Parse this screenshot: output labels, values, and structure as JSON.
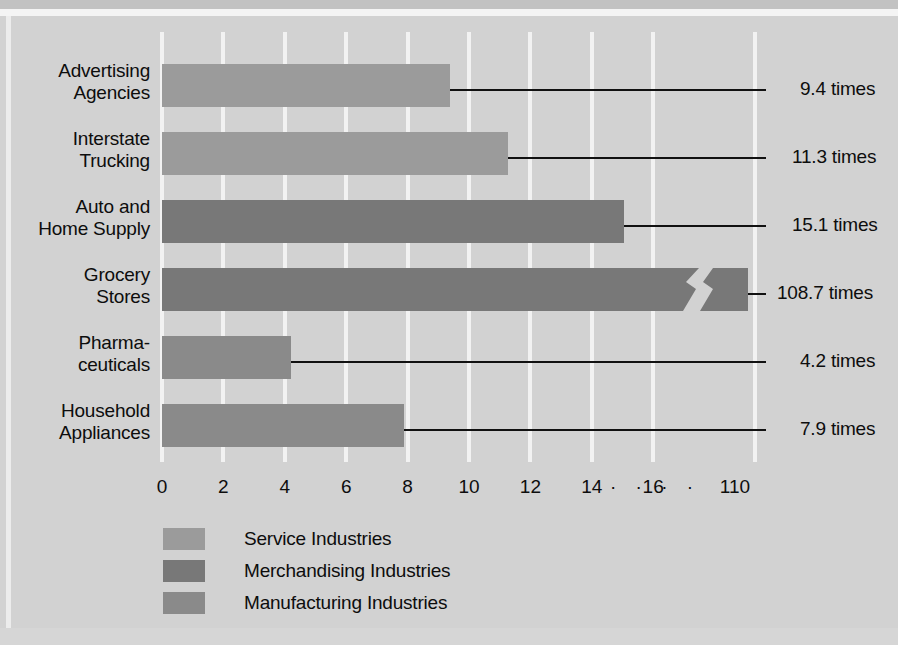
{
  "chart_data": {
    "type": "bar",
    "orientation": "horizontal",
    "title": "",
    "xlabel": "",
    "ylabel": "",
    "grid": true,
    "xlim": [
      0,
      17
    ],
    "axis_break": true,
    "axis_break_note": "16 · · · · 110",
    "categories": [
      "Advertising\nAgencies",
      "Interstate\nTrucking",
      "Auto and\nHome Supply",
      "Grocery\nStores",
      "Pharma-\nceuticals",
      "Household\nAppliances"
    ],
    "values": [
      9.4,
      11.3,
      15.1,
      108.7,
      4.2,
      7.9
    ],
    "value_labels": [
      "9.4 times",
      "11.3 times",
      "15.1 times",
      "108.7 times",
      "4.2 times",
      "7.9 times"
    ],
    "series_of_category": [
      "Service Industries",
      "Service Industries",
      "Merchandising Industries",
      "Merchandising Industries",
      "Manufacturing Industries",
      "Manufacturing Industries"
    ],
    "xticks": [
      0,
      2,
      4,
      6,
      8,
      10,
      12,
      14,
      16
    ],
    "xtick_labels": [
      "0",
      "2",
      "4",
      "6",
      "8",
      "10",
      "12",
      "14",
      "16"
    ],
    "far_tick_label": "110",
    "legend_position": "bottom"
  },
  "categories": [
    {
      "line1": "Advertising",
      "line2": "Agencies"
    },
    {
      "line1": "Interstate",
      "line2": "Trucking"
    },
    {
      "line1": "Auto and",
      "line2": "Home Supply"
    },
    {
      "line1": "Grocery",
      "line2": "Stores"
    },
    {
      "line1": "Pharma-",
      "line2": "ceuticals"
    },
    {
      "line1": "Household",
      "line2": "Appliances"
    }
  ],
  "value_labels": [
    "9.4 times",
    "11.3 times",
    "15.1 times",
    "108.7 times",
    "4.2 times",
    "7.9 times"
  ],
  "axis": {
    "ticks": [
      "0",
      "2",
      "4",
      "6",
      "8",
      "10",
      "12",
      "14",
      "16"
    ],
    "break_dots": "· · · ·",
    "far_tick": "110"
  },
  "legend": {
    "items": [
      {
        "label": "Service Industries",
        "color": "#9b9b9b"
      },
      {
        "label": "Merchandising Industries",
        "color": "#787878"
      },
      {
        "label": "Manufacturing Industries",
        "color": "#8a8a8a"
      }
    ]
  },
  "colors": {
    "background": "#d2d2d2",
    "gridline": "#f2f2f2",
    "text": "#0d0d0d",
    "leader": "#111111",
    "service": "#9b9b9b",
    "merchandising": "#787878",
    "manufacturing": "#8a8a8a"
  }
}
